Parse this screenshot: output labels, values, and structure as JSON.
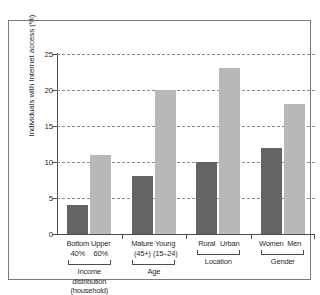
{
  "chart_data": {
    "type": "bar",
    "title": "",
    "subtitle": "",
    "xlabel": "",
    "ylabel": "Individuals with Internet access (%)",
    "ylim": [
      0,
      25
    ],
    "yticks": [
      0,
      5,
      10,
      15,
      20,
      25
    ],
    "ytick_labels": [
      "0",
      "5",
      "10",
      "15",
      "20",
      "25"
    ],
    "grid": true,
    "legend": "none",
    "categories": [
      "Bottom 40%",
      "Upper 60%",
      "Mature (45+)",
      "Young (15–24)",
      "Rural",
      "Urban",
      "Women",
      "Men"
    ],
    "values": [
      4,
      11,
      8,
      20,
      10,
      23,
      12,
      18
    ],
    "bar_colors": [
      "#646464",
      "#b8b8b8",
      "#646464",
      "#b8b8b8",
      "#646464",
      "#b8b8b8",
      "#646464",
      "#b8b8b8"
    ],
    "groups": [
      {
        "name": "Income distribution (household)",
        "categories": [
          "Bottom 40%",
          "Upper 60%"
        ]
      },
      {
        "name": "Age",
        "categories": [
          "Mature (45+)",
          "Young (15–24)"
        ]
      },
      {
        "name": "Location",
        "categories": [
          "Rural",
          "Urban"
        ]
      },
      {
        "name": "Gender",
        "categories": [
          "Women",
          "Men"
        ]
      }
    ],
    "bars": [
      {
        "label_line1": "Bottom",
        "label_line2": "40%",
        "value": 4,
        "color": "#646464",
        "group": "Income distribution (household)"
      },
      {
        "label_line1": "Upper",
        "label_line2": "60%",
        "value": 11,
        "color": "#b8b8b8",
        "group": "Income distribution (household)"
      },
      {
        "label_line1": "Mature",
        "label_line2": "(45+)",
        "value": 8,
        "color": "#646464",
        "group": "Age"
      },
      {
        "label_line1": "Young",
        "label_line2": "(15–24)",
        "value": 20,
        "color": "#b8b8b8",
        "group": "Age"
      },
      {
        "label_line1": "Rural",
        "label_line2": "",
        "value": 10,
        "color": "#646464",
        "group": "Location"
      },
      {
        "label_line1": "Urban",
        "label_line2": "",
        "value": 23,
        "color": "#b8b8b8",
        "group": "Location"
      },
      {
        "label_line1": "Women",
        "label_line2": "",
        "value": 12,
        "color": "#646464",
        "group": "Gender"
      },
      {
        "label_line1": "Men",
        "label_line2": "",
        "value": 18,
        "color": "#b8b8b8",
        "group": "Gender"
      }
    ],
    "group_labels": [
      {
        "line1": "Income",
        "line2": "distribution",
        "line3": "(household)"
      },
      {
        "line1": "Age",
        "line2": "",
        "line3": ""
      },
      {
        "line1": "Location",
        "line2": "",
        "line3": ""
      },
      {
        "line1": "Gender",
        "line2": "",
        "line3": ""
      }
    ]
  }
}
